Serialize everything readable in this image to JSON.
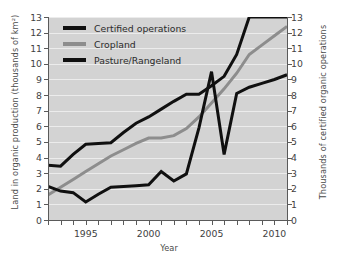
{
  "chart_data": {
    "type": "line",
    "title": "",
    "xlabel": "Year",
    "ylabel": "Land in organic production (thousands of km²)",
    "ylabel_right": "Thousands of certified organic operations",
    "x": [
      1992,
      1993,
      1994,
      1995,
      1996,
      1997,
      1998,
      1999,
      2000,
      2001,
      2002,
      2003,
      2004,
      2005,
      2006,
      2007,
      2008,
      2009,
      2010,
      2011
    ],
    "xlim": [
      1992,
      2011
    ],
    "ylim": [
      0,
      13
    ],
    "ylim_right": [
      0,
      13
    ],
    "xticks": [
      1995,
      2000,
      2005,
      2010
    ],
    "xtick_labels": [
      "1995",
      "2000",
      "2005",
      "2010"
    ],
    "yticks": [
      0,
      1,
      2,
      3,
      4,
      5,
      6,
      7,
      8,
      9,
      10,
      11,
      12,
      13
    ],
    "ytick_labels": [
      "0",
      "1",
      "2",
      "3",
      "4",
      "5",
      "6",
      "7",
      "8",
      "9",
      "10",
      "11",
      "12",
      "13"
    ],
    "yticks_right": [
      0,
      1,
      2,
      3,
      4,
      5,
      6,
      7,
      8,
      9,
      10,
      11,
      12,
      13
    ],
    "ytick_labels_right": [
      "0",
      "1",
      "2",
      "3",
      "4",
      "5",
      "6",
      "7",
      "8",
      "9",
      "10",
      "11",
      "12",
      "13"
    ],
    "grid": true,
    "grid_color": "#ececec",
    "plot_bg": "#d3d3d3",
    "figure_bg": "#ffffff",
    "legend_position": "upper left",
    "series": [
      {
        "name": "Certified operations",
        "axis": "right",
        "color": "#101010",
        "width": 3.0,
        "values": [
          3.5,
          3.45,
          4.2,
          4.85,
          4.9,
          4.95,
          5.6,
          6.2,
          6.6,
          7.1,
          7.6,
          8.05,
          8.05,
          8.6,
          9.2,
          10.6,
          13.0,
          13.0,
          13.0,
          13.0
        ]
      },
      {
        "name": "Cropland",
        "axis": "left",
        "color": "#8d8d8d",
        "width": 3.0,
        "values": [
          1.6,
          2.1,
          2.6,
          3.1,
          3.6,
          4.1,
          4.5,
          4.9,
          5.25,
          5.25,
          5.4,
          5.85,
          6.6,
          7.5,
          8.4,
          9.4,
          10.6,
          11.2,
          11.8,
          12.4
        ]
      },
      {
        "name": "Pasture/Rangeland",
        "axis": "left",
        "color": "#101010",
        "width": 3.0,
        "values": [
          2.15,
          1.85,
          1.75,
          1.15,
          1.65,
          2.1,
          2.15,
          2.2,
          2.25,
          3.1,
          2.5,
          2.95,
          5.9,
          9.5,
          4.2,
          8.1,
          8.5,
          8.75,
          9.0,
          9.3
        ]
      }
    ]
  },
  "legend": {
    "items": [
      {
        "label": "Certified operations",
        "color": "#101010"
      },
      {
        "label": "Cropland",
        "color": "#8d8d8d"
      },
      {
        "label": "Pasture/Rangeland",
        "color": "#101010"
      }
    ]
  }
}
